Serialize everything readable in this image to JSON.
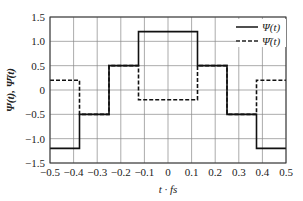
{
  "chart_data": {
    "type": "line",
    "title": "",
    "xlabel": "t · f_s",
    "ylabel": "Ψ(t), Ψ̄(t)",
    "xlim": [
      -0.5,
      0.5
    ],
    "ylim": [
      -1.5,
      1.5
    ],
    "xticks": [
      "−0.5",
      "−0.4",
      "−0.3",
      "−0.2",
      "−0.1",
      "0",
      "0.1",
      "0.2",
      "0.3",
      "0.4",
      "0.5"
    ],
    "yticks": [
      "1.5",
      "1.0",
      "0.5",
      "0",
      "−0.5",
      "−1.0",
      "−1.5"
    ],
    "grid": true,
    "legend_position": "upper right",
    "series": [
      {
        "name": "Ψ(t)",
        "style": "solid",
        "step": true,
        "x": [
          -0.5,
          -0.375,
          -0.375,
          -0.25,
          -0.25,
          -0.125,
          -0.125,
          0.125,
          0.125,
          0.25,
          0.25,
          0.375,
          0.375,
          0.5
        ],
        "y": [
          -1.2,
          -1.2,
          -0.5,
          -0.5,
          0.5,
          0.5,
          1.2,
          1.2,
          0.5,
          0.5,
          -0.5,
          -0.5,
          -1.2,
          -1.2
        ]
      },
      {
        "name": "Ψ̄(t)",
        "style": "dashed",
        "step": true,
        "x": [
          -0.5,
          -0.375,
          -0.375,
          -0.25,
          -0.25,
          -0.125,
          -0.125,
          0.125,
          0.125,
          0.25,
          0.25,
          0.375,
          0.375,
          0.5
        ],
        "y": [
          0.2,
          0.2,
          -0.5,
          -0.5,
          0.5,
          0.5,
          -0.2,
          -0.2,
          0.5,
          0.5,
          -0.5,
          -0.5,
          0.2,
          0.2
        ]
      }
    ]
  },
  "legend": {
    "solid_label": "Ψ(t)",
    "dashed_label": "Ψ̄(t)"
  },
  "axes": {
    "xlabel": "t · fs",
    "ylabel": "Ψ(t), Ψ̄(t)"
  }
}
